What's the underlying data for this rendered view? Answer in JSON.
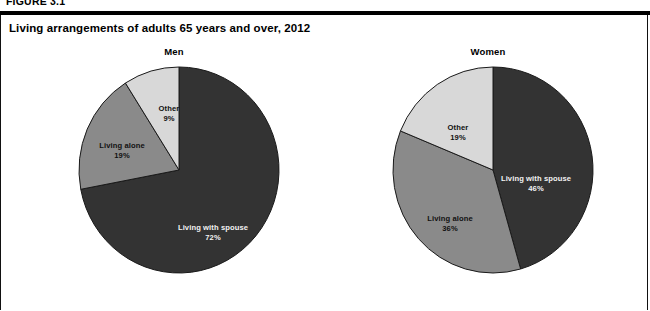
{
  "figure": {
    "number_label": "FIGURE 3.1",
    "title": "Living arrangements of adults 65 years and over, 2012"
  },
  "colors": {
    "spouse": "#333333",
    "alone": "#8a8a8a",
    "other": "#d8d8d8",
    "stroke": "#1a1a1a",
    "label_on_dark": "#f2f2f2",
    "label_on_light": "#111111",
    "rule": "#000000",
    "background": "#ffffff"
  },
  "panels": [
    {
      "id": "men",
      "title": "Men",
      "slices": [
        {
          "name": "spouse",
          "label": "Living with spouse",
          "value": "72%",
          "percent": 72
        },
        {
          "name": "alone",
          "label": "Living alone",
          "value": "19%",
          "percent": 19
        },
        {
          "name": "other",
          "label": "Other",
          "value": "9%",
          "percent": 9
        }
      ]
    },
    {
      "id": "women",
      "title": "Women",
      "slices": [
        {
          "name": "spouse",
          "label": "Living with spouse",
          "value": "46%",
          "percent": 46
        },
        {
          "name": "alone",
          "label": "Living alone",
          "value": "36%",
          "percent": 36
        },
        {
          "name": "other",
          "label": "Other",
          "value": "19%",
          "percent": 19
        }
      ]
    }
  ],
  "chart_data": {
    "type": "pie",
    "title": "Living arrangements of adults 65 years and over, 2012",
    "subtitle": "",
    "xlabel": "",
    "ylabel": "",
    "units": "percent",
    "legend_position": "none (labels drawn inside slices)",
    "grid": false,
    "categories": [
      "Living with spouse",
      "Living alone",
      "Other"
    ],
    "series": [
      {
        "name": "Men",
        "values": [
          72,
          19,
          9
        ]
      },
      {
        "name": "Women",
        "values": [
          46,
          36,
          19
        ]
      }
    ],
    "charts": [
      {
        "title": "Men",
        "type": "pie",
        "labels": [
          "Living with spouse",
          "Living alone",
          "Other"
        ],
        "values": [
          72,
          19,
          9
        ],
        "data_labels": [
          "72%",
          "19%",
          "9%"
        ],
        "start_angle_deg": 0,
        "direction": "clockwise",
        "slice_colors": [
          "#333333",
          "#8a8a8a",
          "#d8d8d8"
        ]
      },
      {
        "title": "Women",
        "type": "pie",
        "labels": [
          "Living with spouse",
          "Living alone",
          "Other"
        ],
        "values": [
          46,
          36,
          19
        ],
        "data_labels": [
          "46%",
          "36%",
          "19%"
        ],
        "start_angle_deg": 0,
        "direction": "clockwise",
        "slice_colors": [
          "#333333",
          "#8a8a8a",
          "#d8d8d8"
        ]
      }
    ]
  }
}
